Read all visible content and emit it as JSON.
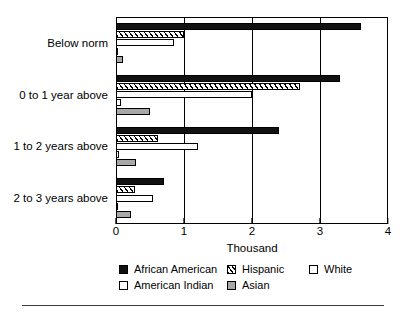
{
  "chart_data": {
    "type": "bar",
    "orientation": "horizontal",
    "title": "",
    "subtitle": "",
    "xlabel": "Thousand",
    "ylabel": "",
    "xlim": [
      0,
      4
    ],
    "xticks": [
      "0",
      "1",
      "2",
      "3",
      "4"
    ],
    "grid": "vertical",
    "legend_position": "bottom",
    "categories": [
      "Below norm",
      "0 to 1 year above",
      "1 to 2 years above",
      "2 to 3 years above"
    ],
    "series": [
      {
        "name": "African American",
        "pattern": "solid-black",
        "color": "#111111",
        "values": [
          3.6,
          3.3,
          2.4,
          0.7
        ]
      },
      {
        "name": "Hispanic",
        "pattern": "diagonal-hatch",
        "color": "#ffffff",
        "values": [
          1.0,
          2.7,
          0.62,
          0.28
        ]
      },
      {
        "name": "White",
        "pattern": "open-white",
        "color": "#ffffff",
        "values": [
          0.85,
          2.0,
          1.2,
          0.55
        ]
      },
      {
        "name": "American Indian",
        "pattern": "open-white",
        "color": "#ffffff",
        "values": [
          0.03,
          0.08,
          0.04,
          0.02
        ]
      },
      {
        "name": "Asian",
        "pattern": "solid-gray",
        "color": "#a8a8a8",
        "values": [
          0.1,
          0.5,
          0.3,
          0.22
        ]
      }
    ]
  },
  "legend": {
    "items": [
      {
        "label": "African American",
        "swatch": "s-black",
        "icon": "legend-swatch-solid-black-icon"
      },
      {
        "label": "Hispanic",
        "swatch": "s-hatch",
        "icon": "legend-swatch-hatched-icon"
      },
      {
        "label": "White",
        "swatch": "s-white",
        "icon": "legend-swatch-open-icon"
      },
      {
        "label": "American Indian",
        "swatch": "s-indian",
        "icon": "legend-swatch-open-icon"
      },
      {
        "label": "Asian",
        "swatch": "s-gray",
        "icon": "legend-swatch-gray-icon"
      }
    ]
  }
}
